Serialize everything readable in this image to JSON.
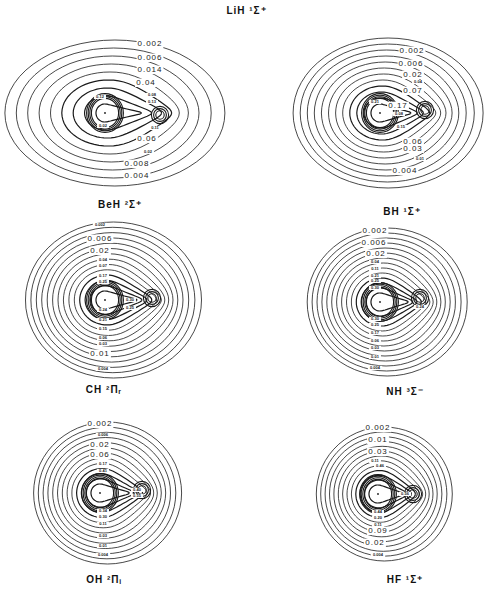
{
  "figure": {
    "title": "LiH ¹Σ⁺",
    "stroke_color": "#1a1a1a",
    "background": "#ffffff"
  },
  "panels": [
    {
      "id": "lih",
      "molecule": "LiH",
      "caption": "BeH ²Σ⁺",
      "center": [
        105,
        113
      ],
      "h_nucleus": [
        160,
        115
      ],
      "outer_rx": 110,
      "outer_ry": 73,
      "n_contours": 9,
      "labels": [
        {
          "text": "0.002",
          "x": 150,
          "y": 46,
          "size": 8
        },
        {
          "text": "0.006",
          "x": 150,
          "y": 60,
          "size": 8
        },
        {
          "text": "0.014",
          "x": 150,
          "y": 72,
          "size": 8
        },
        {
          "text": "0.04",
          "x": 146,
          "y": 85,
          "size": 8
        },
        {
          "text": "0.08",
          "x": 152,
          "y": 96,
          "size": 4
        },
        {
          "text": "0.13",
          "x": 152,
          "y": 103,
          "size": 4
        },
        {
          "text": "0.11",
          "x": 155,
          "y": 129,
          "size": 4
        },
        {
          "text": "0.06",
          "x": 147,
          "y": 141,
          "size": 8
        },
        {
          "text": "0.02",
          "x": 148,
          "y": 153,
          "size": 4
        },
        {
          "text": "0.008",
          "x": 137,
          "y": 166,
          "size": 8
        },
        {
          "text": "0.004",
          "x": 137,
          "y": 178,
          "size": 8
        },
        {
          "text": "0.12",
          "x": 100,
          "y": 98,
          "size": 4
        },
        {
          "text": "0.02",
          "x": 103,
          "y": 127,
          "size": 4
        }
      ]
    },
    {
      "id": "beh",
      "molecule": "BeH",
      "caption": "BH ¹Σ⁺",
      "center": [
        380,
        113
      ],
      "h_nucleus": [
        425,
        110
      ],
      "outer_rx": 95,
      "outer_ry": 75,
      "n_contours": 12,
      "labels": [
        {
          "text": "0.002",
          "x": 412,
          "y": 53,
          "size": 8
        },
        {
          "text": "0.006",
          "x": 411,
          "y": 66,
          "size": 8
        },
        {
          "text": "0.02",
          "x": 413,
          "y": 77,
          "size": 8
        },
        {
          "text": "0.04",
          "x": 418,
          "y": 83,
          "size": 4
        },
        {
          "text": "0.07",
          "x": 413,
          "y": 93,
          "size": 8
        },
        {
          "text": "0.17",
          "x": 398,
          "y": 108,
          "size": 8
        },
        {
          "text": "0.08",
          "x": 399,
          "y": 115,
          "size": 4
        },
        {
          "text": "0.15",
          "x": 401,
          "y": 128,
          "size": 4
        },
        {
          "text": "0.06",
          "x": 413,
          "y": 144,
          "size": 8
        },
        {
          "text": "0.03",
          "x": 413,
          "y": 151,
          "size": 8
        },
        {
          "text": "0.01",
          "x": 420,
          "y": 160,
          "size": 4
        },
        {
          "text": "0.004",
          "x": 405,
          "y": 173,
          "size": 8
        },
        {
          "text": "0.21",
          "x": 375,
          "y": 103,
          "size": 4
        }
      ]
    },
    {
      "id": "bh",
      "molecule": "BH",
      "caption": "CH ²Πᵣ",
      "center": [
        105,
        300
      ],
      "h_nucleus": [
        152,
        298
      ],
      "outer_rx": 88,
      "outer_ry": 78,
      "n_contours": 14,
      "labels": [
        {
          "text": "0.002",
          "x": 100,
          "y": 226,
          "size": 4
        },
        {
          "text": "0.006",
          "x": 100,
          "y": 241,
          "size": 8
        },
        {
          "text": "0.02",
          "x": 100,
          "y": 253,
          "size": 8
        },
        {
          "text": "0.04",
          "x": 103,
          "y": 261,
          "size": 4
        },
        {
          "text": "0.07",
          "x": 103,
          "y": 267,
          "size": 4
        },
        {
          "text": "0.17",
          "x": 103,
          "y": 277,
          "size": 4
        },
        {
          "text": "0.25",
          "x": 103,
          "y": 283,
          "size": 4
        },
        {
          "text": "0.30",
          "x": 130,
          "y": 301,
          "size": 4
        },
        {
          "text": "0.25",
          "x": 130,
          "y": 309,
          "size": 4
        },
        {
          "text": "0.24",
          "x": 103,
          "y": 311,
          "size": 4
        },
        {
          "text": "0.21",
          "x": 103,
          "y": 321,
          "size": 4
        },
        {
          "text": "0.15",
          "x": 103,
          "y": 330,
          "size": 4
        },
        {
          "text": "0.06",
          "x": 103,
          "y": 339,
          "size": 4
        },
        {
          "text": "0.03",
          "x": 103,
          "y": 345,
          "size": 4
        },
        {
          "text": "0.01",
          "x": 100,
          "y": 356,
          "size": 8
        },
        {
          "text": "0.004",
          "x": 103,
          "y": 370,
          "size": 4
        }
      ]
    },
    {
      "id": "ch",
      "molecule": "CH",
      "caption": "NH ³Σ⁻",
      "center": [
        380,
        302
      ],
      "h_nucleus": [
        420,
        298
      ],
      "outer_rx": 80,
      "outer_ry": 74,
      "n_contours": 14,
      "labels": [
        {
          "text": "0.002",
          "x": 375,
          "y": 233,
          "size": 8
        },
        {
          "text": "0.006",
          "x": 374,
          "y": 245,
          "size": 8
        },
        {
          "text": "0.02",
          "x": 376,
          "y": 256,
          "size": 8
        },
        {
          "text": "0.04",
          "x": 375,
          "y": 263,
          "size": 4
        },
        {
          "text": "0.11",
          "x": 375,
          "y": 270,
          "size": 4
        },
        {
          "text": "0.21",
          "x": 375,
          "y": 277,
          "size": 4
        },
        {
          "text": "0.25",
          "x": 375,
          "y": 282,
          "size": 4
        },
        {
          "text": "0.30",
          "x": 375,
          "y": 289,
          "size": 4
        },
        {
          "text": "0.24",
          "x": 420,
          "y": 308,
          "size": 4
        },
        {
          "text": "0.30",
          "x": 375,
          "y": 320,
          "size": 4
        },
        {
          "text": "0.25",
          "x": 375,
          "y": 326,
          "size": 4
        },
        {
          "text": "0.17",
          "x": 375,
          "y": 334,
          "size": 4
        },
        {
          "text": "0.06",
          "x": 375,
          "y": 342,
          "size": 4
        },
        {
          "text": "0.03",
          "x": 375,
          "y": 349,
          "size": 4
        },
        {
          "text": "0.01",
          "x": 375,
          "y": 358,
          "size": 4
        },
        {
          "text": "0.004",
          "x": 375,
          "y": 369,
          "size": 4
        }
      ]
    },
    {
      "id": "nh",
      "molecule": "NH",
      "caption": "OH ²Πᵢ",
      "center": [
        100,
        493
      ],
      "h_nucleus": [
        142,
        490
      ],
      "outer_rx": 74,
      "outer_ry": 71,
      "n_contours": 13,
      "labels": [
        {
          "text": "0.002",
          "x": 100,
          "y": 426,
          "size": 8
        },
        {
          "text": "0.006",
          "x": 103,
          "y": 436,
          "size": 4
        },
        {
          "text": "0.02",
          "x": 100,
          "y": 447,
          "size": 8
        },
        {
          "text": "0.06",
          "x": 100,
          "y": 457,
          "size": 8
        },
        {
          "text": "0.17",
          "x": 103,
          "y": 465,
          "size": 4
        },
        {
          "text": "0.41",
          "x": 103,
          "y": 472,
          "size": 4
        },
        {
          "text": "0.40",
          "x": 137,
          "y": 491,
          "size": 4
        },
        {
          "text": "0.55",
          "x": 137,
          "y": 497,
          "size": 4
        },
        {
          "text": "0.34",
          "x": 103,
          "y": 512,
          "size": 4
        },
        {
          "text": "0.30",
          "x": 103,
          "y": 518,
          "size": 4
        },
        {
          "text": "0.11",
          "x": 103,
          "y": 525,
          "size": 4
        },
        {
          "text": "0.03",
          "x": 103,
          "y": 537,
          "size": 4
        },
        {
          "text": "0.01",
          "x": 103,
          "y": 547,
          "size": 4
        },
        {
          "text": "0.004",
          "x": 103,
          "y": 556,
          "size": 4
        }
      ]
    },
    {
      "id": "oh",
      "molecule": "OH",
      "caption": "HF ¹Σ⁺",
      "center": [
        378,
        494
      ],
      "h_nucleus": [
        413,
        494
      ],
      "outer_rx": 68,
      "outer_ry": 67,
      "n_contours": 13,
      "labels": [
        {
          "text": "0.002",
          "x": 378,
          "y": 430,
          "size": 8
        },
        {
          "text": "0.01",
          "x": 378,
          "y": 442,
          "size": 8
        },
        {
          "text": "0.03",
          "x": 378,
          "y": 454,
          "size": 8
        },
        {
          "text": "0.11",
          "x": 375,
          "y": 462,
          "size": 4
        },
        {
          "text": "0.46",
          "x": 380,
          "y": 467,
          "size": 4
        },
        {
          "text": "0.56",
          "x": 405,
          "y": 495,
          "size": 4
        },
        {
          "text": "0.44",
          "x": 378,
          "y": 513,
          "size": 4
        },
        {
          "text": "0.20",
          "x": 378,
          "y": 519,
          "size": 4
        },
        {
          "text": "0.11",
          "x": 378,
          "y": 526,
          "size": 4
        },
        {
          "text": "0.09",
          "x": 378,
          "y": 533,
          "size": 8
        },
        {
          "text": "0.02",
          "x": 375,
          "y": 545,
          "size": 8
        },
        {
          "text": "0.004",
          "x": 378,
          "y": 556,
          "size": 4
        }
      ]
    }
  ],
  "captions": [
    {
      "text": "BeH ²Σ⁺",
      "x": 60,
      "y": 199
    },
    {
      "text": "BH ¹Σ⁺",
      "x": 342,
      "y": 206
    },
    {
      "text": "CH ²Πᵣ",
      "x": 44,
      "y": 384
    },
    {
      "text": "NH ³Σ⁻",
      "x": 345,
      "y": 386
    },
    {
      "text": "OH ²Πᵢ",
      "x": 44,
      "y": 574
    },
    {
      "text": "HF ¹Σ⁺",
      "x": 345,
      "y": 574
    }
  ]
}
